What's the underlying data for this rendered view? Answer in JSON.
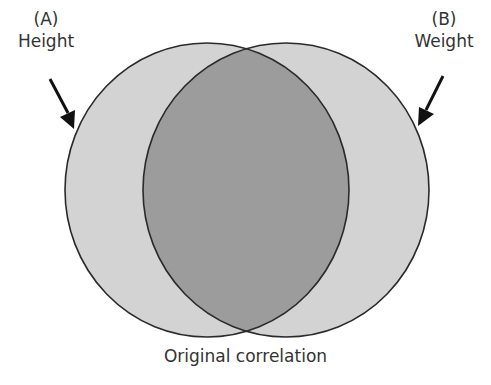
{
  "diagram": {
    "type": "venn",
    "title": "Original correlation",
    "sets": [
      {
        "id": "A",
        "tag": "(A)",
        "label": "Height"
      },
      {
        "id": "B",
        "tag": "(B)",
        "label": "Weight"
      }
    ],
    "overlap": "shared variance (A ∩ B)",
    "colors": {
      "circle_fill": "#d3d3d3",
      "overlap_fill": "#9c9c9c",
      "outline": "#2a2a2a",
      "arrow": "#111111"
    }
  }
}
